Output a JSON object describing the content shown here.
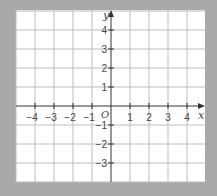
{
  "diagram": {
    "type": "cartesian-grid",
    "x_axis_label": "x",
    "y_axis_label": "y",
    "origin_label": "O",
    "x_range": [
      -5,
      5
    ],
    "y_range": [
      -4,
      5
    ],
    "x_tick_labels": [
      "−4",
      "−3",
      "−2",
      "−1",
      "1",
      "2",
      "3",
      "4"
    ],
    "x_tick_values": [
      -4,
      -3,
      -2,
      -1,
      1,
      2,
      3,
      4
    ],
    "y_tick_labels": [
      "4",
      "3",
      "2",
      "1",
      "−1",
      "−2",
      "−3"
    ],
    "y_tick_values": [
      4,
      3,
      2,
      1,
      -1,
      -2,
      -3
    ],
    "colors": {
      "background": "#a9a9a9",
      "plot_area": "#ffffff",
      "grid": "#bdbdbd",
      "axis": "#333333",
      "text": "#444444"
    }
  }
}
